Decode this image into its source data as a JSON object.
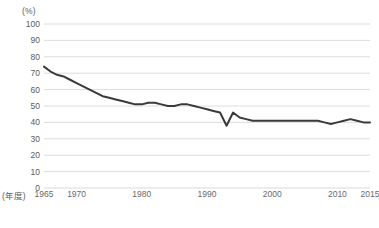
{
  "chart_data": {
    "type": "line",
    "title": "",
    "subtitle": "",
    "xlabel": "(年度)",
    "ylabel": "(%)",
    "unit_label": "(%)",
    "xlim": [
      1965,
      2015
    ],
    "ylim": [
      0,
      100
    ],
    "ytick_step": 10,
    "yticks": [
      100,
      90,
      80,
      70,
      60,
      50,
      40,
      30,
      20,
      10,
      0
    ],
    "xticks": [
      1965,
      1970,
      1980,
      1990,
      2000,
      2010,
      2015
    ],
    "grid": "horizontal",
    "legend": "none",
    "line_color": "#3a3a3a",
    "grid_color": "#d9d9d9",
    "series": [
      {
        "name": "",
        "x": [
          1965,
          1966,
          1967,
          1968,
          1969,
          1970,
          1971,
          1972,
          1973,
          1974,
          1975,
          1976,
          1977,
          1978,
          1979,
          1980,
          1981,
          1982,
          1983,
          1984,
          1985,
          1986,
          1987,
          1988,
          1989,
          1990,
          1991,
          1992,
          1993,
          1994,
          1995,
          1996,
          1997,
          1998,
          1999,
          2000,
          2001,
          2002,
          2003,
          2004,
          2005,
          2006,
          2007,
          2008,
          2009,
          2010,
          2011,
          2012,
          2013,
          2014,
          2015
        ],
        "values": [
          74,
          71,
          69,
          68,
          66,
          64,
          62,
          60,
          58,
          56,
          55,
          54,
          53,
          52,
          51,
          51,
          52,
          52,
          51,
          50,
          50,
          51,
          51,
          50,
          49,
          48,
          47,
          46,
          38,
          46,
          43,
          42,
          41,
          41,
          41,
          41,
          41,
          41,
          41,
          41,
          41,
          41,
          41,
          40,
          39,
          40,
          41,
          42,
          41,
          40,
          40
        ]
      }
    ]
  },
  "axis": {
    "unit": "(%)",
    "x_axis_title": "(年度)"
  },
  "caption": {
    "text": ""
  }
}
